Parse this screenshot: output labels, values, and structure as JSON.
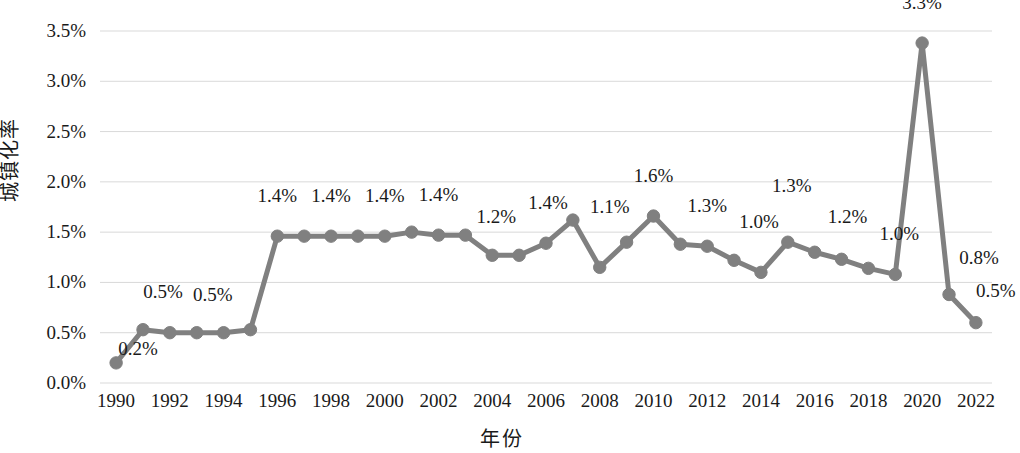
{
  "chart_data": {
    "type": "line",
    "title": "",
    "xlabel": "年份",
    "ylabel": "城镇化率",
    "grid": true,
    "legend": false,
    "xlim": [
      1989.4,
      2022.6
    ],
    "ylim": [
      0.0,
      3.5
    ],
    "y_ticks": [
      "0.0%",
      "0.5%",
      "1.0%",
      "1.5%",
      "2.0%",
      "2.5%",
      "3.0%",
      "3.5%"
    ],
    "y_tick_values": [
      0.0,
      0.5,
      1.0,
      1.5,
      2.0,
      2.5,
      3.0,
      3.5
    ],
    "x_ticks": [
      "1990",
      "1992",
      "1994",
      "1996",
      "1998",
      "2000",
      "2002",
      "2004",
      "2006",
      "2008",
      "2010",
      "2012",
      "2014",
      "2016",
      "2018",
      "2020",
      "2022"
    ],
    "x_tick_values": [
      1990,
      1992,
      1994,
      1996,
      1998,
      2000,
      2002,
      2004,
      2006,
      2008,
      2010,
      2012,
      2014,
      2016,
      2018,
      2020,
      2022
    ],
    "series_color": "#808080",
    "gridline_color": "#d9d9d9",
    "x": [
      1990,
      1991,
      1992,
      1993,
      1994,
      1995,
      1996,
      1997,
      1998,
      1999,
      2000,
      2001,
      2002,
      2003,
      2004,
      2005,
      2006,
      2007,
      2008,
      2009,
      2010,
      2011,
      2012,
      2013,
      2014,
      2015,
      2016,
      2017,
      2018,
      2019,
      2020,
      2021,
      2022
    ],
    "values": [
      0.2,
      0.53,
      0.5,
      0.5,
      0.5,
      0.53,
      1.46,
      1.46,
      1.46,
      1.46,
      1.46,
      1.5,
      1.47,
      1.47,
      1.27,
      1.27,
      1.39,
      1.62,
      1.15,
      1.4,
      1.66,
      1.38,
      1.36,
      1.22,
      1.1,
      1.4,
      1.3,
      1.23,
      1.14,
      1.08,
      3.38,
      0.88,
      0.6
    ],
    "point_labels": [
      {
        "year": 1990,
        "text": "0.2%",
        "dx": 22,
        "dy": 0
      },
      {
        "year": 1991,
        "text": "0.5%",
        "dx": 20,
        "dy": -24
      },
      {
        "year": 1993,
        "text": "0.5%",
        "dx": 16,
        "dy": -24
      },
      {
        "year": 1996,
        "text": "1.4%",
        "dx": 0,
        "dy": -26
      },
      {
        "year": 1998,
        "text": "1.4%",
        "dx": 0,
        "dy": -26
      },
      {
        "year": 2000,
        "text": "1.4%",
        "dx": 0,
        "dy": -26
      },
      {
        "year": 2002,
        "text": "1.4%",
        "dx": 0,
        "dy": -26
      },
      {
        "year": 2004,
        "text": "1.2%",
        "dx": 4,
        "dy": -24
      },
      {
        "year": 2006,
        "text": "1.4%",
        "dx": 2,
        "dy": -26
      },
      {
        "year": 2008,
        "text": "1.1%",
        "dx": 10,
        "dy": -46
      },
      {
        "year": 2010,
        "text": "1.6%",
        "dx": 0,
        "dy": -26
      },
      {
        "year": 2012,
        "text": "1.3%",
        "dx": 0,
        "dy": -26
      },
      {
        "year": 2014,
        "text": "1.0%",
        "dx": -2,
        "dy": -36
      },
      {
        "year": 2015,
        "text": "1.3%",
        "dx": 4,
        "dy": -42
      },
      {
        "year": 2017,
        "text": "1.2%",
        "dx": 6,
        "dy": -28
      },
      {
        "year": 2019,
        "text": "1.0%",
        "dx": 4,
        "dy": -26
      },
      {
        "year": 2020,
        "text": "3.3%",
        "dx": 0,
        "dy": -26
      },
      {
        "year": 2021,
        "text": "0.8%",
        "dx": 30,
        "dy": -22
      },
      {
        "year": 2022,
        "text": "0.5%",
        "dx": 20,
        "dy": -18
      }
    ]
  }
}
